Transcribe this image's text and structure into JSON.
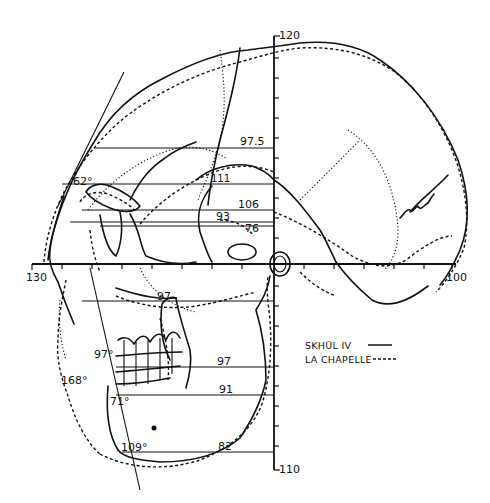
{
  "figure": {
    "type": "comparative lateral skull outline diagram",
    "vertical_axis": {
      "top_label": "120",
      "bottom_label": "110"
    },
    "horizontal_axis": {
      "left_label": "130",
      "right_label": "100"
    },
    "measurement_lines": [
      {
        "id": "m1",
        "label": "97.5"
      },
      {
        "id": "m2",
        "label": "111"
      },
      {
        "id": "m3",
        "label": "106"
      },
      {
        "id": "m4",
        "label": "93"
      },
      {
        "id": "m5",
        "label": "76"
      },
      {
        "id": "m6",
        "label": "97"
      },
      {
        "id": "m7",
        "label": "97"
      },
      {
        "id": "m8",
        "label": "91"
      },
      {
        "id": "m9",
        "label": "82"
      }
    ],
    "angles": [
      {
        "id": "a1",
        "label": "62°"
      },
      {
        "id": "a2",
        "label": "97°"
      },
      {
        "id": "a3",
        "label": "168°"
      },
      {
        "id": "a4",
        "label": "71°"
      },
      {
        "id": "a5",
        "label": "109°"
      }
    ],
    "legend": [
      {
        "name": "SKHŪL IV",
        "style": "solid",
        "sample": "———"
      },
      {
        "name": "LA CHAPELLE",
        "style": "dashed",
        "sample": "-----"
      }
    ]
  }
}
